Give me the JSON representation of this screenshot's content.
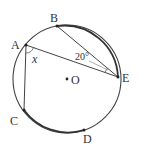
{
  "diagram": {
    "type": "circle-inscribed-angles",
    "circle": {
      "center_label": "O",
      "cx": 67,
      "cy": 79,
      "r": 54
    },
    "points": [
      {
        "label": "A",
        "x": 26,
        "y": 45
      },
      {
        "label": "B",
        "x": 57,
        "y": 26
      },
      {
        "label": "C",
        "x": 24,
        "y": 110
      },
      {
        "label": "D",
        "x": 84,
        "y": 130
      },
      {
        "label": "E",
        "x": 118,
        "y": 77
      }
    ],
    "segments": [
      "AB?",
      "BE",
      "AE",
      "AC"
    ],
    "bold_arcs": [
      "BE",
      "CD"
    ],
    "angles": [
      {
        "at": "A",
        "between": [
          "C",
          "E"
        ],
        "label": "x"
      },
      {
        "at": "E",
        "between": [
          "B",
          "A"
        ],
        "label": "20°"
      }
    ]
  },
  "labels": {
    "A": "A",
    "B": "B",
    "C": "C",
    "D": "D",
    "E": "E",
    "O": "O",
    "angle_x": "x",
    "angle_20": "20°"
  }
}
